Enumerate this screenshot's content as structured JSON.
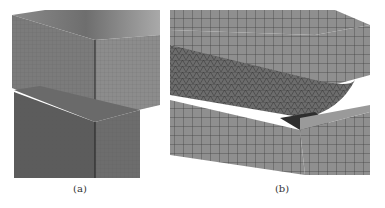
{
  "figure": {
    "panels": [
      {
        "id": "a",
        "caption": "(a)",
        "description": "Two stacked rectangular blocks with fine hexahedral mesh, upper block offset"
      },
      {
        "id": "b",
        "caption": "(b)",
        "description": "Grooved block meshed with hexahedral elements and a cylindrical roller with tetrahedral mesh in the groove"
      }
    ]
  }
}
